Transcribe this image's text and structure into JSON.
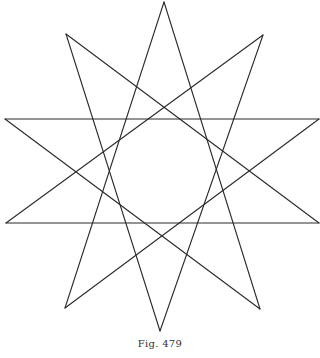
{
  "figure": {
    "caption": "Fig. 479",
    "shape": "ten-pointed star (two interlaced pentagrams)",
    "stroke_color": "#2a2a2a",
    "background": "#ffffff",
    "vertices": [
      {
        "name": "top",
        "x": 164,
        "y": 2
      },
      {
        "name": "upper-right",
        "x": 263,
        "y": 35
      },
      {
        "name": "right",
        "x": 319,
        "y": 119
      },
      {
        "name": "lower-right",
        "x": 319,
        "y": 223
      },
      {
        "name": "bottom-right",
        "x": 260,
        "y": 309
      },
      {
        "name": "bottom",
        "x": 160,
        "y": 331
      },
      {
        "name": "bottom-left",
        "x": 65,
        "y": 308
      },
      {
        "name": "lower-left",
        "x": 6,
        "y": 223
      },
      {
        "name": "left",
        "x": 5,
        "y": 119
      },
      {
        "name": "upper-left",
        "x": 66,
        "y": 34
      }
    ],
    "edges": [
      [
        0,
        4
      ],
      [
        4,
        8
      ],
      [
        8,
        2
      ],
      [
        2,
        6
      ],
      [
        6,
        0
      ],
      [
        1,
        5
      ],
      [
        5,
        9
      ],
      [
        9,
        3
      ],
      [
        3,
        7
      ],
      [
        7,
        1
      ]
    ]
  }
}
